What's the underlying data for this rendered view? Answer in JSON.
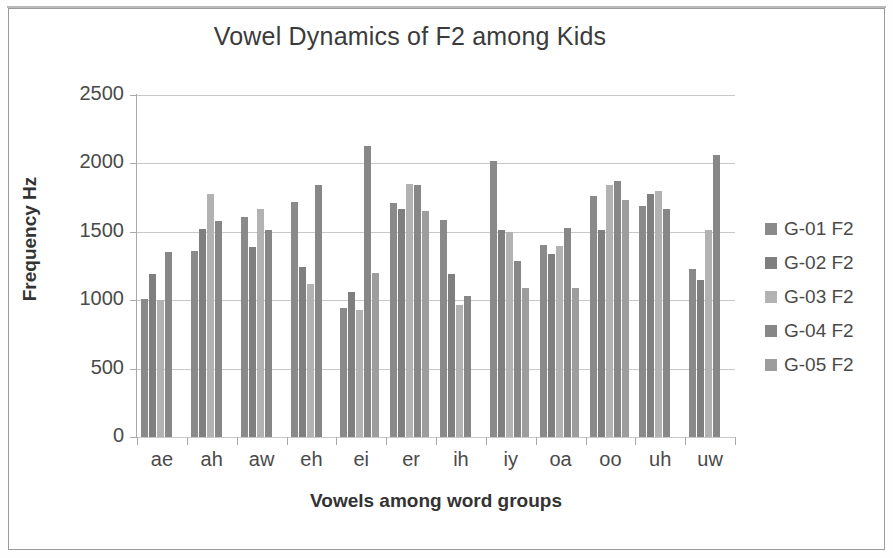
{
  "chart_data": {
    "type": "bar",
    "title": "Vowel Dynamics of F2 among Kids",
    "xlabel": "Vowels among word groups",
    "ylabel": "Frequency Hz",
    "ylim": [
      0,
      2500
    ],
    "ytick_step": 500,
    "yticks": [
      "2500",
      "2000",
      "1500",
      "1000",
      "500",
      "0"
    ],
    "ytick_values": [
      2500,
      2000,
      1500,
      1000,
      500,
      0
    ],
    "grid": true,
    "legend_position": "right",
    "categories": [
      "ae",
      "ah",
      "aw",
      "eh",
      "ei",
      "er",
      "ih",
      "iy",
      "oa",
      "oo",
      "uh",
      "uw"
    ],
    "series": [
      {
        "name": "G-01 F2",
        "color": "#8a8a8a",
        "values": [
          1010,
          1360,
          1610,
          1715,
          940,
          1710,
          1590,
          2015,
          1400,
          1760,
          1690,
          1225
        ]
      },
      {
        "name": "G-02 F2",
        "color": "#7f7f7f",
        "values": [
          1190,
          1520,
          1390,
          1240,
          1060,
          1670,
          1190,
          1515,
          1340,
          1515,
          1780,
          1145
        ]
      },
      {
        "name": "G-03 F2",
        "color": "#b2b2b2",
        "values": [
          1005,
          1780,
          1670,
          1120,
          925,
          1850,
          965,
          1500,
          1395,
          1845,
          1795,
          1510
        ]
      },
      {
        "name": "G-04 F2",
        "color": "#878787",
        "values": [
          1355,
          1580,
          1515,
          1845,
          2125,
          1840,
          1030,
          1290,
          1530,
          1870,
          1670,
          2065
        ]
      },
      {
        "name": "G-05 F2",
        "color": "#9d9d9d",
        "values": [
          null,
          null,
          null,
          null,
          1200,
          1655,
          null,
          1090,
          1090,
          1730,
          null,
          null
        ]
      }
    ],
    "bars": [
      {
        "category": "ae",
        "values": [
          1010,
          1190,
          1005,
          1355
        ]
      },
      {
        "category": "ah",
        "values": [
          1360,
          1520,
          1780,
          1580
        ]
      },
      {
        "category": "aw",
        "values": [
          1610,
          1390,
          1670,
          1515
        ]
      },
      {
        "category": "eh",
        "values": [
          1715,
          1240,
          1120,
          1845
        ]
      },
      {
        "category": "ei",
        "values": [
          940,
          1060,
          925,
          2125,
          1200
        ]
      },
      {
        "category": "er",
        "values": [
          1710,
          1670,
          1850,
          1840,
          1655
        ]
      },
      {
        "category": "ih",
        "values": [
          1590,
          1190,
          965,
          1030
        ]
      },
      {
        "category": "iy",
        "values": [
          2015,
          1515,
          1500,
          1290,
          1090
        ]
      },
      {
        "category": "oa",
        "values": [
          1400,
          1340,
          1395,
          1530,
          1090
        ]
      },
      {
        "category": "oo",
        "values": [
          1760,
          1515,
          1845,
          1870,
          1730
        ]
      },
      {
        "category": "uh",
        "values": [
          1690,
          1780,
          1795,
          1670
        ]
      },
      {
        "category": "uw",
        "values": [
          1225,
          1145,
          1510,
          2065
        ]
      }
    ]
  },
  "legend": {
    "items": [
      {
        "label": "G-01 F2",
        "color": "#8a8a8a"
      },
      {
        "label": "G-02 F2",
        "color": "#7f7f7f"
      },
      {
        "label": "G-03 F2",
        "color": "#b2b2b2"
      },
      {
        "label": "G-04 F2",
        "color": "#878787"
      },
      {
        "label": "G-05 F2",
        "color": "#9d9d9d"
      }
    ]
  }
}
